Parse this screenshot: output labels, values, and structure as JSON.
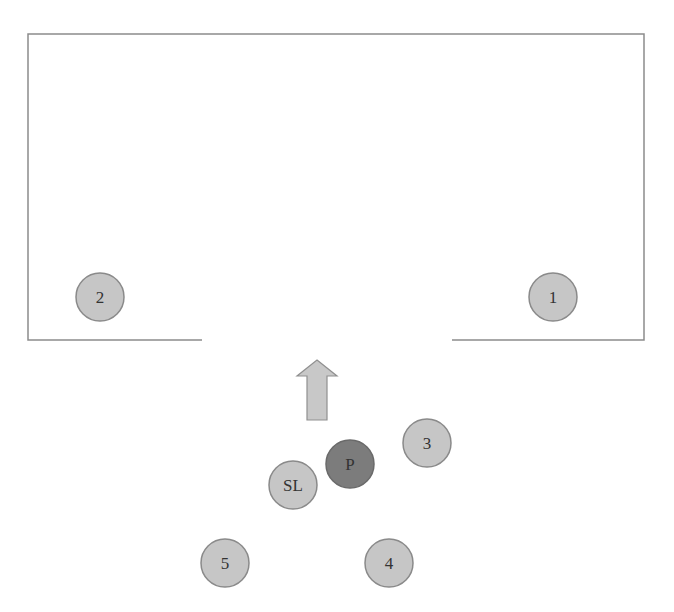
{
  "diagram": {
    "type": "formation-diagram",
    "colors": {
      "line": "#8c8c8c",
      "circle_fill": "#c6c6c6",
      "circle_stroke": "#8a8a8a",
      "highlight_fill": "#7c7c7c",
      "arrow_fill": "#c8c8c8",
      "arrow_stroke": "#909090",
      "text": "#333333"
    },
    "room": {
      "top_left": [
        28,
        34
      ],
      "top_right": [
        644,
        34
      ],
      "bottom_y": 340,
      "left_wall_end_x": 202,
      "right_wall_start_x": 452
    },
    "arrow": {
      "direction": "up",
      "tip": [
        317,
        360
      ],
      "base_y": 420
    },
    "nodes": [
      {
        "id": "1",
        "label": "1",
        "cx": 553,
        "cy": 297,
        "r": 24,
        "highlight": false
      },
      {
        "id": "2",
        "label": "2",
        "cx": 100,
        "cy": 297,
        "r": 24,
        "highlight": false
      },
      {
        "id": "3",
        "label": "3",
        "cx": 427,
        "cy": 443,
        "r": 24,
        "highlight": false
      },
      {
        "id": "P",
        "label": "P",
        "cx": 350,
        "cy": 464,
        "r": 24,
        "highlight": true
      },
      {
        "id": "SL",
        "label": "SL",
        "cx": 293,
        "cy": 485,
        "r": 24,
        "highlight": false
      },
      {
        "id": "5",
        "label": "5",
        "cx": 225,
        "cy": 563,
        "r": 24,
        "highlight": false
      },
      {
        "id": "4",
        "label": "4",
        "cx": 389,
        "cy": 563,
        "r": 24,
        "highlight": false
      }
    ]
  }
}
